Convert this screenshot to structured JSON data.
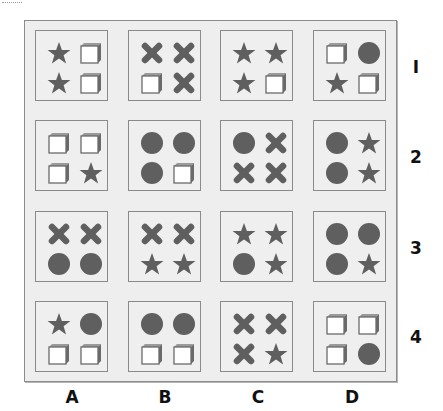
{
  "puzzle": {
    "columns": [
      "A",
      "B",
      "C",
      "D"
    ],
    "rows": [
      "1",
      "2",
      "3",
      "4"
    ],
    "shape_color": "#5f5f5f",
    "cube_color": "#6a6a6a",
    "cells": [
      [
        [
          "star",
          "cube",
          "star",
          "cube"
        ],
        [
          "cross",
          "cross",
          "cube",
          "cross"
        ],
        [
          "star",
          "star",
          "star",
          "cube"
        ],
        [
          "cube",
          "circle",
          "star",
          "cube"
        ]
      ],
      [
        [
          "cube",
          "cube",
          "cube",
          "star"
        ],
        [
          "circle",
          "circle",
          "circle",
          "cube"
        ],
        [
          "circle",
          "cross",
          "cross",
          "cross"
        ],
        [
          "circle",
          "star",
          "circle",
          "star"
        ]
      ],
      [
        [
          "cross",
          "cross",
          "circle",
          "circle"
        ],
        [
          "cross",
          "cross",
          "star",
          "star"
        ],
        [
          "star",
          "star",
          "circle",
          "star"
        ],
        [
          "circle",
          "circle",
          "circle",
          "star"
        ]
      ],
      [
        [
          "star",
          "circle",
          "cube",
          "cube"
        ],
        [
          "circle",
          "circle",
          "cube",
          "cube"
        ],
        [
          "cross",
          "cross",
          "cross",
          "star"
        ],
        [
          "cube",
          "cube",
          "cube",
          "circle"
        ]
      ]
    ]
  }
}
